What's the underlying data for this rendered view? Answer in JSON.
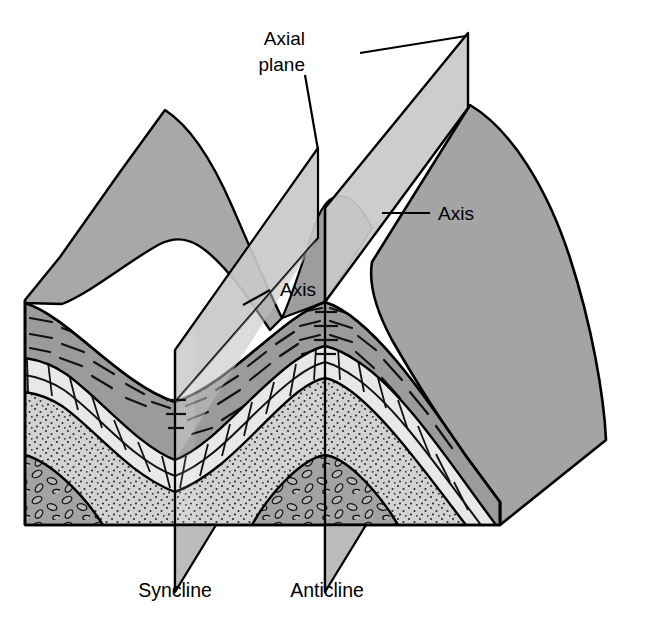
{
  "diagram": {
    "background_color": "#ffffff",
    "line_color": "#000000",
    "labels": {
      "axial_plane": "Axial plane",
      "axis_right": "Axis",
      "axis_left": "Axis",
      "syncline": "Syncline",
      "anticline": "Anticline"
    },
    "label_positions": {
      "axial_plane_line1": {
        "text": "Axial plane",
        "x": 305,
        "y": 45
      },
      "axis_right": {
        "x": 438,
        "y": 219
      },
      "axis_left": {
        "x": 280,
        "y": 295
      },
      "syncline": {
        "x": 175,
        "y": 596
      },
      "anticline": {
        "x": 327,
        "y": 596
      }
    },
    "colors": {
      "topographic_surface": "#a8a8a8",
      "topographic_surface_right": "#a0a0a0",
      "axial_plane_fill": "#c4c4c4",
      "axial_plane_tab": "#bdbdbd",
      "shale_layer": "#9a9a9a",
      "limestone_layer": "#e6e6e6",
      "sandstone_layer": "#cfcfcf",
      "conglomerate_layer": "#9f9f9f",
      "outline": "#000000"
    },
    "structures": [
      {
        "name": "syncline",
        "axis_x": 175,
        "type": "downfold"
      },
      {
        "name": "anticline",
        "axis_x": 325,
        "type": "upfold"
      }
    ],
    "rock_units": [
      {
        "name": "shale",
        "pattern": "dashes",
        "order": 1
      },
      {
        "name": "limestone",
        "pattern": "brick",
        "order": 2
      },
      {
        "name": "sandstone",
        "pattern": "stipple",
        "order": 3
      },
      {
        "name": "conglomerate",
        "pattern": "ovals",
        "order": 4
      }
    ]
  }
}
